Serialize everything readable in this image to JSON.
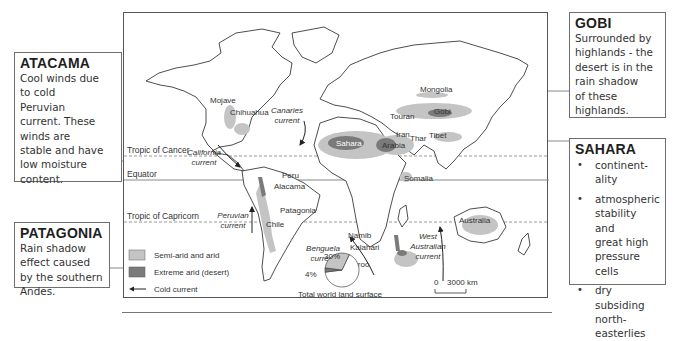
{
  "callouts": {
    "atacama": {
      "title": "ATACAMA",
      "lines": [
        "Cool winds due",
        "to cold",
        "Peruvian",
        "current. These",
        "winds are",
        "stable and have",
        "low moisture",
        "content."
      ]
    },
    "patagonia": {
      "title": "PATAGONIA",
      "lines": [
        "Rain shadow",
        "effect caused",
        "by the southern",
        "Andes."
      ]
    },
    "gobi": {
      "title": "GOBI",
      "lines": [
        "Surrounded by",
        "highlands - the",
        "desert is in the",
        "rain shadow",
        "of these",
        "highlands."
      ]
    },
    "sahara": {
      "title": "SAHARA",
      "bullets": [
        [
          "continent-",
          "ality"
        ],
        [
          "atmospheric",
          "stability and",
          "great high",
          "pressure cells"
        ],
        [
          "dry subsiding",
          "north-",
          "easterlies"
        ]
      ],
      "bullet_char": "•"
    }
  },
  "map": {
    "lines": {
      "tropic_cancer": "Tropic of Cancer",
      "equator": "Equator",
      "tropic_capricorn": "Tropic of Capricorn"
    },
    "deserts": {
      "mojave": "Mojave",
      "chihuahua": "Chihuahua",
      "peru": "Peru",
      "atacama": "Alacama",
      "patagonia": "Patagonia",
      "chile": "Chile",
      "sahara": "Sahara",
      "arabia": "Arabia",
      "iran": "Iran",
      "thar": "Thar",
      "tibet": "Tibet",
      "touran": "Touran",
      "gobi": "Gobi",
      "mongolia": "Mongolia",
      "somalia": "Somalia",
      "namib": "Namib",
      "kalahari": "Kalahari",
      "karoo": "Karoo",
      "australia": "Australia"
    },
    "currents": {
      "california": [
        "California",
        "current"
      ],
      "canaries": [
        "Canaries",
        "current"
      ],
      "peruvian": [
        "Peruvian",
        "current"
      ],
      "benguela": [
        "Benguela",
        "current"
      ],
      "west_australian": [
        "West",
        "Australian",
        "current"
      ]
    },
    "legend": {
      "semi_arid": "Semi-arid and arid",
      "extreme_arid": "Extreme arid (desert)",
      "cold_current": "Cold current"
    },
    "colors": {
      "semi_arid": "#c4c4c4",
      "extreme_arid": "#7a7a7a",
      "outline": "#3a3a3a"
    },
    "pie": {
      "title": "Total world land surface",
      "slices": [
        {
          "label": "30%",
          "value": 30,
          "category": "Semi-arid and arid"
        },
        {
          "label": "4%",
          "value": 4,
          "category": "Extreme arid (desert)"
        },
        {
          "label": "",
          "value": 66,
          "category": "Other land"
        }
      ]
    },
    "scale": {
      "start": "0",
      "end": "3000 km"
    }
  }
}
